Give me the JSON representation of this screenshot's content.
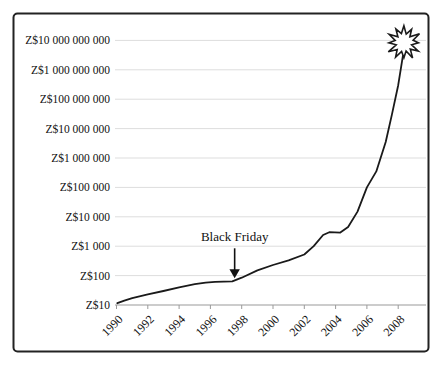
{
  "figure": {
    "background": "#ffffff",
    "border_color": "#222222"
  },
  "chart_data": {
    "type": "line",
    "title": "",
    "xlabel": "",
    "ylabel": "",
    "y_axis": {
      "scale": "log",
      "tick_labels": [
        "Z$10",
        "Z$100",
        "Z$1 000",
        "Z$10 000",
        "Z$100 000",
        "Z$1 000 000",
        "Z$10 000 000",
        "Z$100 000 000",
        "Z$1 000 000 000",
        "Z$10 000 000 000"
      ],
      "tick_values": [
        10,
        100,
        1000,
        10000,
        100000,
        1000000,
        10000000,
        100000000,
        1000000000,
        10000000000
      ]
    },
    "x_axis": {
      "range": [
        1990,
        2008
      ],
      "tick_labels": [
        "1990",
        "1992",
        "1994",
        "1996",
        "1998",
        "2000",
        "2002",
        "2004",
        "2006",
        "2008"
      ]
    },
    "grid": "horizontal-faint",
    "legend": "none",
    "colors": {
      "line": "#1a1a1a",
      "gridline": "#dddddd",
      "axis": "#9a9a9a",
      "text": "#111111"
    },
    "series": [
      {
        "points": [
          [
            1990.05,
            11.5
          ],
          [
            1990.5,
            14
          ],
          [
            1991,
            17
          ],
          [
            1992,
            23
          ],
          [
            1993,
            30
          ],
          [
            1994,
            40
          ],
          [
            1995,
            51
          ],
          [
            1995.7,
            58
          ],
          [
            1996.3,
            61
          ],
          [
            1997.4,
            64
          ],
          [
            1998,
            85
          ],
          [
            1999,
            150
          ],
          [
            2000,
            230
          ],
          [
            2001,
            330
          ],
          [
            2002,
            520
          ],
          [
            2002.6,
            1000
          ],
          [
            2003.2,
            2400
          ],
          [
            2003.6,
            3000
          ],
          [
            2004.3,
            2900
          ],
          [
            2004.8,
            4500
          ],
          [
            2005.4,
            15000
          ],
          [
            2006,
            100000
          ],
          [
            2006.6,
            350000
          ],
          [
            2007.2,
            3500000
          ],
          [
            2007.6,
            30000000
          ],
          [
            2008,
            300000000
          ],
          [
            2008.3,
            3000000000
          ]
        ]
      }
    ],
    "annotations": [
      {
        "text": "Black Friday",
        "arrow_points_to": {
          "year": 1997.55,
          "value": 64
        }
      }
    ],
    "end_marker": "explosion-burst"
  }
}
